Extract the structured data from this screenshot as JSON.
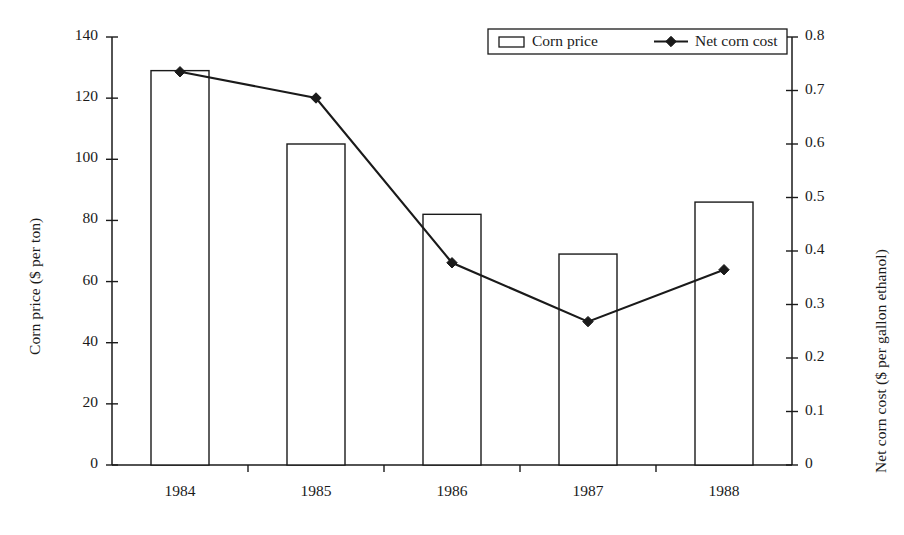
{
  "chart_data": {
    "type": "bar",
    "title": "",
    "subtitle": "",
    "xlabel": "",
    "ylabel": "Corn price ($ per ton)",
    "y2label": "Net corn cost ($ per gallon ethanol)",
    "categories": [
      "1984",
      "1985",
      "1986",
      "1987",
      "1988"
    ],
    "series": [
      {
        "name": "Corn price",
        "type": "bar",
        "axis": "left",
        "unit": "$ per ton",
        "values": [
          129,
          105,
          82,
          69,
          86
        ]
      },
      {
        "name": "Net corn cost",
        "type": "line",
        "axis": "right",
        "unit": "$ per gallon ethanol",
        "marker": "filled-diamond",
        "values": [
          0.735,
          0.686,
          0.378,
          0.268,
          0.365
        ]
      }
    ],
    "ylim": [
      0,
      140
    ],
    "yticks": [
      0,
      20,
      40,
      60,
      80,
      100,
      120,
      140
    ],
    "ytick_labels": [
      "0",
      "20",
      "40",
      "60",
      "80",
      "100",
      "120",
      "140"
    ],
    "y2lim": [
      0,
      0.8
    ],
    "y2ticks": [
      0,
      0.1,
      0.2,
      0.3,
      0.4,
      0.5,
      0.6,
      0.7,
      0.8
    ],
    "y2tick_labels": [
      "0",
      "0.1",
      "0.2",
      "0.3",
      "0.4",
      "0.5",
      "0.6",
      "0.7",
      "0.8"
    ],
    "grid": false,
    "legend_position": "top-right",
    "legend_entries": [
      "Corn price",
      "Net corn cost"
    ],
    "colors": {
      "line": "#1a1a1a",
      "bar_fill": "#ffffff",
      "bar_stroke": "#1a1a1a",
      "axis": "#1a1a1a",
      "background": "#ffffff"
    }
  },
  "legend": {
    "corn_price_label": "Corn price",
    "net_corn_cost_label": "Net corn cost"
  },
  "axes": {
    "left_title": "Corn price ($ per ton)",
    "right_title": "Net corn cost ($ per gallon ethanol)"
  }
}
